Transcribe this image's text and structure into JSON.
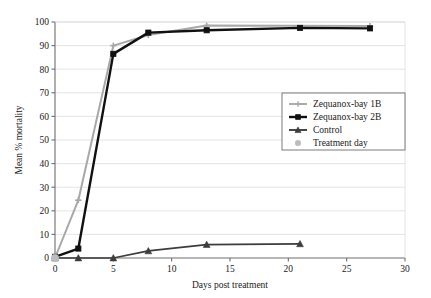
{
  "chart_data": {
    "type": "line",
    "title": "",
    "xlabel": "Days post treatment",
    "ylabel": "Mean % mortality",
    "xlim": [
      0,
      30
    ],
    "ylim": [
      0,
      100
    ],
    "xticks": [
      0,
      5,
      10,
      15,
      20,
      25,
      30
    ],
    "yticks": [
      0,
      10,
      20,
      30,
      40,
      50,
      60,
      70,
      80,
      90,
      100
    ],
    "grid": "horizontal",
    "legend_position": "center-right",
    "series": [
      {
        "name": "Zequanox-bay 1B",
        "color": "#a8a8a8",
        "marker": "plus-bar",
        "x": [
          0,
          2,
          5,
          8,
          13,
          27
        ],
        "values": [
          0,
          24.5,
          90,
          94.5,
          98.5,
          98.3
        ]
      },
      {
        "name": "Zequanox-bay 2B",
        "color": "#111111",
        "marker": "square",
        "x": [
          0,
          2,
          5,
          8,
          13,
          21,
          27
        ],
        "values": [
          0.5,
          4,
          86.5,
          95.5,
          96.5,
          97.5,
          97.3
        ]
      },
      {
        "name": "Control",
        "color": "#3d3d3d",
        "marker": "triangle",
        "x": [
          0,
          2,
          5,
          8,
          13,
          21
        ],
        "values": [
          0,
          0,
          0,
          3,
          5.7,
          6
        ]
      },
      {
        "name": "Treatment day",
        "color": "#bcbcbc",
        "marker": "circle",
        "x": [
          0
        ],
        "values": [
          0
        ]
      }
    ]
  },
  "legend": {
    "items": [
      {
        "label": "Zequanox-bay 1B",
        "color": "#a8a8a8",
        "marker": "plus-bar"
      },
      {
        "label": "Zequanox-bay 2B",
        "color": "#111111",
        "marker": "square"
      },
      {
        "label": "Control",
        "color": "#3d3d3d",
        "marker": "triangle"
      },
      {
        "label": "Treatment day",
        "color": "#bcbcbc",
        "marker": "circle"
      }
    ]
  },
  "axes": {
    "x_title": "Days post treatment",
    "y_title": "Mean % mortality",
    "x_tick_labels": [
      "0",
      "5",
      "10",
      "15",
      "20",
      "25",
      "30"
    ],
    "y_tick_labels": [
      "0",
      "10",
      "20",
      "30",
      "40",
      "50",
      "60",
      "70",
      "80",
      "90",
      "100"
    ]
  }
}
